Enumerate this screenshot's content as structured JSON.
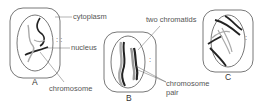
{
  "diagram": {
    "type": "cell-division-stages",
    "panels": [
      {
        "id": "A",
        "label": "A",
        "annotations": [
          "cytoplasm",
          "nucleus",
          "chromosome"
        ]
      },
      {
        "id": "B",
        "label": "B",
        "annotations": [
          "two chromatids",
          "chromosome",
          "pair"
        ]
      },
      {
        "id": "C",
        "label": "C",
        "annotations": []
      }
    ],
    "labels": {
      "cytoplasm": "cytoplasm",
      "nucleus": "nucleus",
      "chromosome": "chromosome",
      "two_chromatids": "two chromatids",
      "chromosome_pair_line1": "chromosome",
      "chromosome_pair_line2": "pair",
      "panel_a": "A",
      "panel_b": "B",
      "panel_c": "C"
    },
    "colors": {
      "outline": "#555555",
      "chromosome_dark": "#222222",
      "chromosome_light": "#aaaaaa",
      "text": "#555555"
    }
  }
}
